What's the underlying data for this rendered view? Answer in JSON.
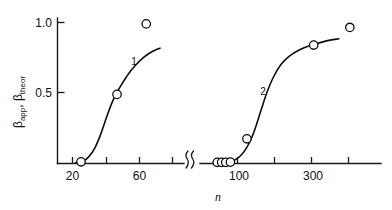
{
  "chart_data": {
    "type": "line",
    "title": "",
    "subtitle": "",
    "xlabel": "n",
    "ylabel_parts": [
      "β",
      "app",
      ", ",
      "β",
      "theor"
    ],
    "ylabel": "βapp, βtheor",
    "xscale": "log",
    "x_axis_broken": true,
    "break_label": "axis-break",
    "grid": false,
    "legend": "none",
    "ylim": [
      0,
      1.08
    ],
    "y_ticks": [
      {
        "value": 0.5,
        "label": "0.5"
      },
      {
        "value": 1.0,
        "label": "1.0"
      }
    ],
    "x_segments": [
      {
        "name": "left",
        "xlim": [
          15,
          90
        ],
        "ticks": [
          {
            "value": 20,
            "label": "20"
          },
          {
            "value": 35,
            "label": ""
          },
          {
            "value": 60,
            "label": "60"
          },
          {
            "value": 80,
            "label": ""
          }
        ]
      },
      {
        "name": "right",
        "xlim": [
          70,
          600
        ],
        "ticks": [
          {
            "value": 100,
            "label": "100"
          },
          {
            "value": 170,
            "label": ""
          },
          {
            "value": 300,
            "label": "300"
          },
          {
            "value": 450,
            "label": ""
          }
        ]
      }
    ],
    "series": [
      {
        "name": "1",
        "label": "1",
        "segment": "left",
        "kind": "curve-with-points",
        "curve": [
          {
            "x": 21.0,
            "y": 0.005
          },
          {
            "x": 23.0,
            "y": 0.012
          },
          {
            "x": 25.0,
            "y": 0.03
          },
          {
            "x": 27.0,
            "y": 0.065
          },
          {
            "x": 29.0,
            "y": 0.115
          },
          {
            "x": 31.0,
            "y": 0.18
          },
          {
            "x": 33.0,
            "y": 0.255
          },
          {
            "x": 35.0,
            "y": 0.33
          },
          {
            "x": 38.0,
            "y": 0.425
          },
          {
            "x": 41.0,
            "y": 0.495
          },
          {
            "x": 45.0,
            "y": 0.565
          },
          {
            "x": 50.0,
            "y": 0.635
          },
          {
            "x": 56.0,
            "y": 0.695
          },
          {
            "x": 63.0,
            "y": 0.745
          },
          {
            "x": 70.0,
            "y": 0.78
          },
          {
            "x": 78.0,
            "y": 0.805
          },
          {
            "x": 84.0,
            "y": 0.818
          }
        ],
        "points": [
          {
            "x": 23.0,
            "y": 0.012
          },
          {
            "x": 41.5,
            "y": 0.49
          },
          {
            "x": 67.0,
            "y": 0.99
          }
        ]
      },
      {
        "name": "2",
        "label": "2",
        "segment": "right",
        "kind": "curve-with-points",
        "curve": [
          {
            "x": 88.0,
            "y": 0.01
          },
          {
            "x": 95.0,
            "y": 0.022
          },
          {
            "x": 103.0,
            "y": 0.048
          },
          {
            "x": 112.0,
            "y": 0.095
          },
          {
            "x": 122.0,
            "y": 0.17
          },
          {
            "x": 132.0,
            "y": 0.27
          },
          {
            "x": 143.0,
            "y": 0.39
          },
          {
            "x": 155.0,
            "y": 0.505
          },
          {
            "x": 170.0,
            "y": 0.61
          },
          {
            "x": 190.0,
            "y": 0.7
          },
          {
            "x": 215.0,
            "y": 0.76
          },
          {
            "x": 250.0,
            "y": 0.805
          },
          {
            "x": 300.0,
            "y": 0.84
          },
          {
            "x": 370.0,
            "y": 0.868
          },
          {
            "x": 450.0,
            "y": 0.885
          }
        ],
        "points": [
          {
            "x": 74.0,
            "y": 0.008
          },
          {
            "x": 79.0,
            "y": 0.008
          },
          {
            "x": 84.0,
            "y": 0.008
          },
          {
            "x": 90.0,
            "y": 0.01
          },
          {
            "x": 115.0,
            "y": 0.175
          },
          {
            "x": 310.0,
            "y": 0.84
          },
          {
            "x": 530.0,
            "y": 0.965
          }
        ]
      }
    ],
    "annotations": [
      {
        "text": "1",
        "series": "1",
        "x": 36,
        "y": 0.635,
        "segment": "left"
      },
      {
        "text": "2",
        "series": "2",
        "x": 128,
        "y": 0.52,
        "segment": "right"
      }
    ],
    "marker_style": {
      "shape": "open-circle",
      "radius_px": 4.2,
      "stroke": "#0d0d0d",
      "fill": "#ffffff"
    },
    "line_color": "#0d0d0d",
    "axis_color": "#1a1a1a",
    "background": "#ffffff"
  }
}
